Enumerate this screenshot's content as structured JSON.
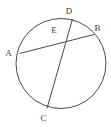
{
  "figure": {
    "kind": "circle-with-intersecting-chords",
    "background_color": "#ffffff",
    "stroke_color": "#4a4a4a",
    "label_color": "#3c3c3c",
    "circle": {
      "cx": 61,
      "cy": 63.5,
      "r": 45
    },
    "points": [
      {
        "id": "A",
        "label": "A",
        "px": 19.5,
        "py": 53.5,
        "label_x": 8.5,
        "label_y": 56.0
      },
      {
        "id": "B",
        "label": "B",
        "px": 94.0,
        "py": 34.5,
        "label_x": 97.5,
        "label_y": 31.0
      },
      {
        "id": "C",
        "label": "C",
        "px": 47.0,
        "py": 108.5,
        "label_x": 43.5,
        "label_y": 121.0
      },
      {
        "id": "D",
        "label": "D",
        "px": 72.5,
        "py": 19.0,
        "label_x": 69.0,
        "label_y": 14.0
      },
      {
        "id": "E",
        "label": "E",
        "px": 62.0,
        "py": 35.5,
        "label_x": 54.0,
        "label_y": 33.0
      }
    ],
    "chords": [
      {
        "id": "chord-AB",
        "from": "A",
        "to": "B"
      },
      {
        "id": "chord-DC",
        "from": "D",
        "to": "C"
      }
    ]
  }
}
